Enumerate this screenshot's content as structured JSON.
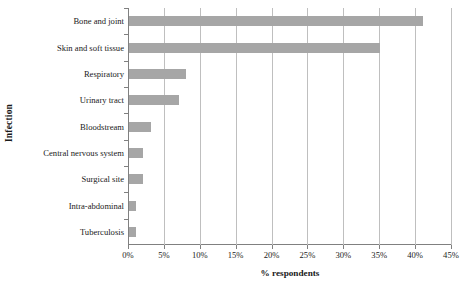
{
  "chart_data": {
    "type": "bar",
    "orientation": "horizontal",
    "title": "",
    "xlabel": "% respondents",
    "ylabel": "Infection",
    "categories": [
      "Bone and joint",
      "Skin and soft tissue",
      "Respiratory",
      "Urinary tract",
      "Bloodstream",
      "Central nervous system",
      "Surgical site",
      "Intra-abdominal",
      "Tuberculosis"
    ],
    "values": [
      41,
      35,
      8,
      7,
      3,
      2,
      2,
      1,
      1
    ],
    "xlim": [
      0,
      45
    ],
    "xtick_labels": [
      "0%",
      "5%",
      "10%",
      "15%",
      "20%",
      "25%",
      "30%",
      "35%",
      "40%",
      "45%"
    ],
    "xtick_values": [
      0,
      5,
      10,
      15,
      20,
      25,
      30,
      35,
      40,
      45
    ],
    "grid": "vertical",
    "legend": "none",
    "bar_color": "#a6a6a6",
    "gridline_color": "#bfbfbf",
    "axis_color": "#808080",
    "text_color": "#1a1a1a"
  }
}
